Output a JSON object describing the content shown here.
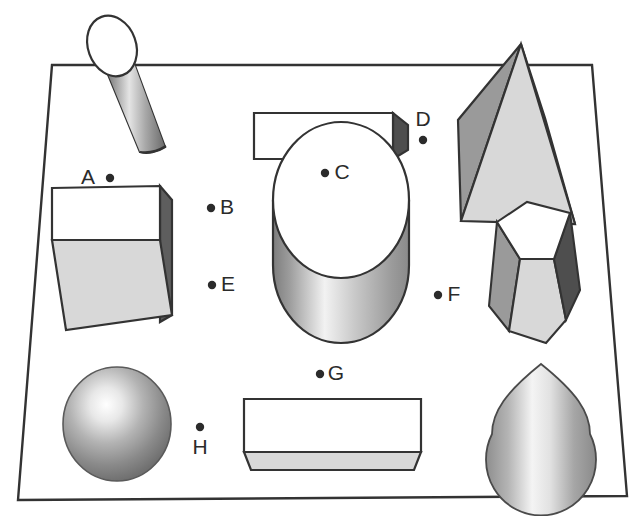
{
  "scene": {
    "title": "Three-dimensional shapes on a receding ground plane",
    "background_color": "#ffffff",
    "line_color": "#333333",
    "label_color": "#2b2b2b",
    "plane": {
      "name": "ground-plane",
      "shape": "trapezoid",
      "corners": [
        [
          52,
          65
        ],
        [
          592,
          65
        ],
        [
          627,
          496
        ],
        [
          18,
          500
        ]
      ],
      "fill": "#ffffff",
      "stroke": "#333333"
    },
    "palette": {
      "white_face": "#ffffff",
      "light_gray": "#d8d8d8",
      "mid_gray": "#9a9a9a",
      "dark_gray": "#5e5e5e",
      "outline": "#333333"
    }
  },
  "labels": [
    {
      "id": "A",
      "letter": "A",
      "dot_side": "right",
      "letter_x": 88,
      "letter_y": 178,
      "dot_x": 110,
      "dot_y": 178
    },
    {
      "id": "B",
      "letter": "B",
      "dot_side": "left",
      "letter_x": 227,
      "letter_y": 208,
      "dot_x": 211,
      "dot_y": 208
    },
    {
      "id": "C",
      "letter": "C",
      "dot_side": "left",
      "letter_x": 342,
      "letter_y": 173,
      "dot_x": 325,
      "dot_y": 173
    },
    {
      "id": "D",
      "letter": "D",
      "dot_side": "below",
      "letter_x": 423,
      "letter_y": 120,
      "dot_x": 423,
      "dot_y": 140
    },
    {
      "id": "E",
      "letter": "E",
      "dot_side": "left",
      "letter_x": 228,
      "letter_y": 285,
      "dot_x": 212,
      "dot_y": 285
    },
    {
      "id": "F",
      "letter": "F",
      "dot_side": "left",
      "letter_x": 454,
      "letter_y": 295,
      "dot_x": 438,
      "dot_y": 295
    },
    {
      "id": "G",
      "letter": "G",
      "dot_side": "left",
      "letter_x": 336,
      "letter_y": 374,
      "dot_x": 320,
      "dot_y": 374
    },
    {
      "id": "H",
      "letter": "H",
      "dot_side": "above",
      "letter_x": 200,
      "letter_y": 448,
      "dot_x": 200,
      "dot_y": 427
    }
  ],
  "shapes": [
    {
      "id": "cylinder-tilted",
      "name": "tilted-cylinder",
      "label": "A",
      "position": "top-left",
      "faces": "elliptical white top, shaded tube body"
    },
    {
      "id": "cube",
      "name": "cube",
      "label": "B",
      "position": "mid-left",
      "faces": "white front, light gray lower face, dark gray right face"
    },
    {
      "id": "box-long-top",
      "name": "long-rectangular-box",
      "label": "C",
      "position": "top-center",
      "faces": "white top, dark gray right end"
    },
    {
      "id": "pyramid",
      "name": "square-pyramid",
      "label": "D",
      "position": "top-right",
      "faces": "light gray front, mid gray left, dark gray right"
    },
    {
      "id": "cylinder-upright",
      "name": "upright-cylinder",
      "label": "E",
      "position": "center",
      "faces": "white elliptical top, gradient body"
    },
    {
      "id": "hex-prism",
      "name": "hexagonal-prism",
      "label": "F",
      "position": "mid-right",
      "faces": "white hexagon top, three shaded sides"
    },
    {
      "id": "box-flat-bottom",
      "name": "flat-rectangular-box",
      "label": "G",
      "position": "bottom-center",
      "faces": "white top, light gray front strip"
    },
    {
      "id": "sphere",
      "name": "sphere",
      "label": "H",
      "position": "bottom-left",
      "faces": "radial gradient highlight upper-left"
    },
    {
      "id": "cone",
      "name": "cone",
      "label": "",
      "position": "bottom-right",
      "faces": "teardrop outline, vertical gradient"
    }
  ]
}
